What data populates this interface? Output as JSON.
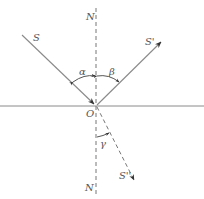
{
  "diagram": {
    "title": "",
    "colors": {
      "line": "#8a8a8a",
      "arrow": "#333333",
      "text": "#555555",
      "background": "#ffffff"
    },
    "labels": {
      "normal_top": "N",
      "normal_bottom": "N",
      "incident_ray": "S",
      "reflected_ray": "S'",
      "refracted_ray": "S''",
      "origin": "O",
      "incidence_angle": "α",
      "reflection_angle": "β",
      "refraction_angle": "γ"
    },
    "elements": [
      {
        "id": "interface",
        "type": "solid-line",
        "desc": "horizontal boundary surface"
      },
      {
        "id": "normal",
        "type": "dashed-line",
        "desc": "normal N–N through O"
      },
      {
        "id": "incident",
        "type": "solid-arrow",
        "from": "S",
        "to": "O"
      },
      {
        "id": "reflected",
        "type": "solid-arrow",
        "from": "O",
        "to": "S'"
      },
      {
        "id": "refracted",
        "type": "dashed-arrow",
        "from": "O",
        "to": "S''"
      },
      {
        "id": "arc-alpha",
        "type": "angle-arc",
        "between": [
          "incident",
          "normal"
        ]
      },
      {
        "id": "arc-beta",
        "type": "angle-arc",
        "between": [
          "normal",
          "reflected"
        ]
      },
      {
        "id": "arc-gamma",
        "type": "angle-arc",
        "between": [
          "normal",
          "refracted"
        ]
      }
    ]
  }
}
